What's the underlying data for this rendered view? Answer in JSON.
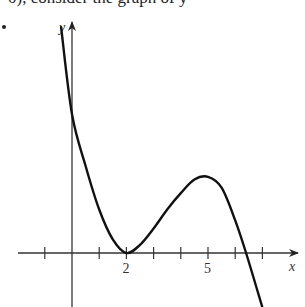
{
  "header": {
    "text": "0), consider the graph of y ="
  },
  "chart_data": {
    "type": "line",
    "title": "",
    "xlabel": "x",
    "ylabel": "y",
    "x_tick_labels": [
      {
        "x": 2,
        "label": "2"
      },
      {
        "x": 5,
        "label": "5"
      }
    ],
    "x_ticks": [
      -1,
      1,
      2,
      3,
      4,
      5,
      6,
      7
    ],
    "xlim": [
      -2,
      8.3
    ],
    "ylim": [
      -2,
      8.4
    ],
    "grid": false,
    "legend": null,
    "series": [
      {
        "name": "y = f(x)",
        "x": [
          -0.4,
          0,
          0.5,
          1,
          1.5,
          2,
          2.5,
          3,
          3.5,
          4,
          4.5,
          5,
          5.5,
          6,
          6.4,
          7
        ],
        "y": [
          8.3,
          5.1,
          3.2,
          1.6,
          0.5,
          0,
          0.3,
          0.9,
          1.6,
          2.2,
          2.7,
          2.8,
          2.4,
          1.2,
          0,
          -2.0
        ]
      }
    ],
    "key_points": {
      "y_intercept": 5.1,
      "local_min": [
        2,
        0
      ],
      "local_max": [
        5,
        2.8
      ],
      "x_intercept": 6.4
    }
  }
}
